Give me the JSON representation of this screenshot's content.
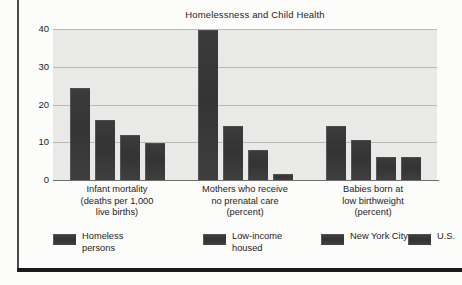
{
  "figure": {
    "title": "Homelessness and Child Health"
  },
  "chart_data": {
    "type": "bar",
    "title": "Homelessness and Child Health",
    "xlabel": "",
    "ylabel": "",
    "ylim": [
      0,
      40
    ],
    "yticks": [
      0,
      10,
      20,
      30,
      40
    ],
    "ytick_labels": [
      "0",
      "10",
      "20",
      "30",
      "40"
    ],
    "grid": true,
    "grid_axis": "y",
    "legend_position": "bottom",
    "bar_color": "#3a3a3a",
    "plot_background": "#e9e9e7",
    "categories": [
      "Infant mortality (deaths per 1,000 live births)",
      "Mothers who receive no prenatal care (percent)",
      "Babies born at low birthweight (percent)"
    ],
    "category_lines": [
      [
        "Infant mortality",
        "(deaths per 1,000",
        "live births)"
      ],
      [
        "Mothers who receive",
        "no prenatal care",
        "(percent)"
      ],
      [
        "Babies born at",
        "low birthweight",
        "(percent)"
      ]
    ],
    "series": [
      {
        "name": "Homeless persons",
        "values": [
          24.5,
          39.8,
          14.3
        ]
      },
      {
        "name": "Low-income housed",
        "values": [
          16.0,
          14.3,
          10.5
        ]
      },
      {
        "name": "New York City",
        "values": [
          12.0,
          8.0,
          6.2
        ]
      },
      {
        "name": "U.S.",
        "values": [
          9.8,
          1.5,
          6.2
        ]
      }
    ]
  },
  "legend": {
    "items": [
      {
        "label_lines": [
          "Homeless",
          "persons"
        ],
        "name": "Homeless persons"
      },
      {
        "label_lines": [
          "Low-income",
          "housed"
        ],
        "name": "Low-income housed"
      },
      {
        "label_lines": [
          "New York City"
        ],
        "name": "New York City"
      },
      {
        "label_lines": [
          "U.S."
        ],
        "name": "U.S."
      }
    ]
  }
}
